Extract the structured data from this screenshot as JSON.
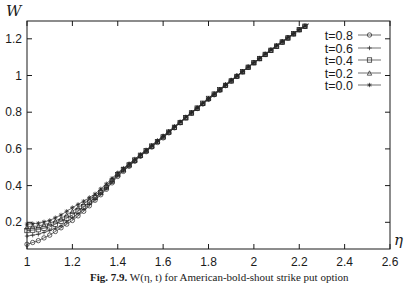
{
  "chart_data": {
    "type": "line",
    "title": "",
    "xlabel": "η",
    "ylabel": "W",
    "xlim": [
      1,
      2.6
    ],
    "ylim": [
      0.05,
      1.3
    ],
    "grid": false,
    "legend_position": "top-right inside",
    "x_ticks": [
      "1",
      "1.2",
      "1.4",
      "1.6",
      "1.8",
      "2",
      "2.2",
      "2.4",
      "2.6"
    ],
    "y_ticks": [
      "0.2",
      "0.4",
      "0.6",
      "0.8",
      "1",
      "1.2"
    ],
    "x": [
      1.0,
      1.05,
      1.1,
      1.15,
      1.2,
      1.25,
      1.3,
      1.35,
      1.4,
      1.5,
      1.6,
      1.7,
      1.8,
      1.9,
      2.0,
      2.1,
      2.2,
      2.24
    ],
    "series": [
      {
        "name": "t=0.8",
        "marker": "circle",
        "values": [
          0.08,
          0.1,
          0.13,
          0.17,
          0.21,
          0.26,
          0.32,
          0.38,
          0.45,
          0.56,
          0.66,
          0.77,
          0.87,
          0.97,
          1.07,
          1.16,
          1.25,
          1.28
        ]
      },
      {
        "name": "t=0.6",
        "marker": "plus",
        "values": [
          0.125,
          0.135,
          0.155,
          0.18,
          0.225,
          0.27,
          0.325,
          0.385,
          0.455,
          0.56,
          0.665,
          0.77,
          0.87,
          0.97,
          1.07,
          1.16,
          1.25,
          1.28
        ]
      },
      {
        "name": "t=0.4",
        "marker": "square",
        "values": [
          0.155,
          0.16,
          0.175,
          0.205,
          0.24,
          0.285,
          0.335,
          0.39,
          0.46,
          0.565,
          0.665,
          0.77,
          0.875,
          0.97,
          1.07,
          1.16,
          1.25,
          1.28
        ]
      },
      {
        "name": "t=0.2",
        "marker": "triangle",
        "values": [
          0.175,
          0.18,
          0.195,
          0.22,
          0.26,
          0.3,
          0.345,
          0.4,
          0.465,
          0.565,
          0.67,
          0.77,
          0.875,
          0.975,
          1.07,
          1.16,
          1.25,
          1.28
        ]
      },
      {
        "name": "t=0.0",
        "marker": "star",
        "values": [
          0.19,
          0.195,
          0.21,
          0.24,
          0.28,
          0.315,
          0.355,
          0.41,
          0.47,
          0.57,
          0.67,
          0.775,
          0.875,
          0.975,
          1.07,
          1.165,
          1.25,
          1.28
        ]
      }
    ],
    "caption": "Fig. 7.9. W(η, t) for American-bold-shout strike put option"
  },
  "axes": {
    "ylabel": "W",
    "xlabel": "η"
  },
  "caption": {
    "prefix": "Fig. 7.9.",
    "text": "W(η, t) for American-bold-shout strike put option"
  }
}
